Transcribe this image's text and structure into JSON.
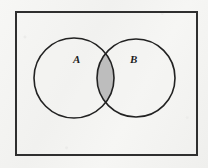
{
  "figure": {
    "kind": "venn-diagram",
    "width": 208,
    "height": 168,
    "background_color": "#f5f5f3"
  },
  "colors": {
    "stroke": "#2b2b2b",
    "rectangle_stroke": "#2f2f2f",
    "circle_stroke": "#222222",
    "intersection_fill": "#bdbdbd",
    "circle_fill": "#f3f3f1",
    "label_color": "#1d1d1d"
  },
  "universal_set": {
    "shape": "rectangle",
    "x": 15,
    "y": 11,
    "width": 183,
    "height": 145,
    "stroke_width": 2
  },
  "sets": [
    {
      "id": "A",
      "label": "A",
      "shape": "circle",
      "cx": 74,
      "cy": 78,
      "r": 40,
      "stroke_width": 1.6,
      "label_x": 77,
      "label_y": 60
    },
    {
      "id": "B",
      "label": "B",
      "shape": "circle",
      "cx": 136,
      "cy": 78,
      "r": 39,
      "stroke_width": 1.6,
      "label_x": 134,
      "label_y": 60
    }
  ],
  "shaded_region": {
    "name": "intersection",
    "notation": "A ∩ B",
    "fill": "#bdbdbd",
    "x_span": [
      99,
      113
    ]
  }
}
